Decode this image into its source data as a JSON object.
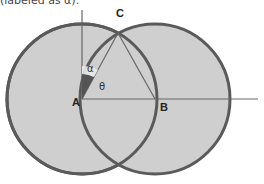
{
  "caption": "(labeled as α).",
  "diagram": {
    "points": {
      "A": {
        "label": "A",
        "x": 82,
        "y": 99
      },
      "B": {
        "label": "B",
        "x": 155,
        "y": 99
      },
      "C": {
        "label": "C",
        "x": 118,
        "y": 33
      }
    },
    "angle_labels": {
      "alpha": "α",
      "theta": "θ"
    },
    "circles": [
      {
        "name": "circle-A",
        "center": "A",
        "radius": 75
      },
      {
        "name": "circle-B",
        "center": "B",
        "radius": 75
      }
    ],
    "colors": {
      "fill": "#cfcfcf",
      "stroke": "#5a5a5a",
      "line": "#666666",
      "wedge": "#555555"
    }
  }
}
